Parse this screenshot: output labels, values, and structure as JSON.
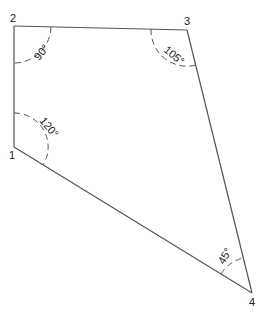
{
  "diagram": {
    "type": "quadrilateral-angles",
    "line_color": "#555555",
    "text_color": "#222222",
    "vertices": [
      {
        "id": "1",
        "label": "1",
        "x": 14,
        "y": 147
      },
      {
        "id": "2",
        "label": "2",
        "x": 14,
        "y": 26
      },
      {
        "id": "3",
        "label": "3",
        "x": 187,
        "y": 30
      },
      {
        "id": "4",
        "label": "4",
        "x": 252,
        "y": 293
      }
    ],
    "edges": [
      {
        "from": "1",
        "to": "2"
      },
      {
        "from": "2",
        "to": "3"
      },
      {
        "from": "3",
        "to": "4"
      },
      {
        "from": "4",
        "to": "1"
      }
    ],
    "angles": [
      {
        "vertex": "2",
        "label": "90°"
      },
      {
        "vertex": "3",
        "label": "105°"
      },
      {
        "vertex": "1",
        "label": "120°"
      },
      {
        "vertex": "4",
        "label": "45°"
      }
    ]
  }
}
